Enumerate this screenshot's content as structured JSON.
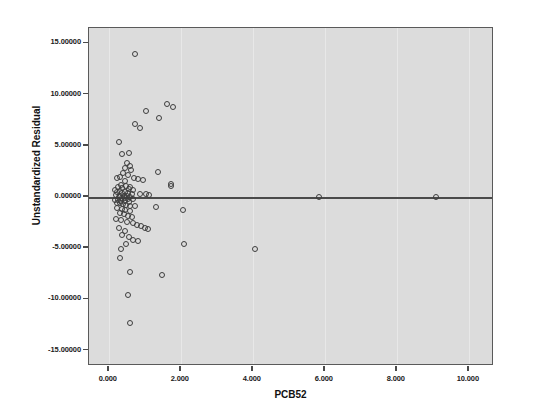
{
  "chart_data": {
    "type": "scatter",
    "title": "",
    "xlabel": "PCB52",
    "ylabel": "Unstandardized Residual",
    "xlim": [
      -0.55,
      10.7
    ],
    "ylim": [
      -16.5,
      16.5
    ],
    "xticks": [
      0,
      2,
      4,
      6,
      8,
      10
    ],
    "xticklabels": [
      "0.000",
      "2.000",
      "4.000",
      "6.000",
      "8.000",
      "10.000"
    ],
    "yticks": [
      15,
      10,
      5,
      0,
      -5,
      -10,
      -15
    ],
    "yticklabels": [
      "15.00000",
      "10.00000",
      "5.00000",
      "0.00000",
      "-5.00000",
      "-10.00000",
      "-15.00000"
    ],
    "grid": false,
    "reference_line_y": 0,
    "marker": "open-circle",
    "marker_color": "#3d3d3d",
    "plot_background": "#dcdcdc",
    "figure_background": "#ffffff",
    "n_points": 96,
    "points": [
      [
        0.72,
        14.0
      ],
      [
        1.62,
        9.1
      ],
      [
        1.78,
        8.75
      ],
      [
        1.02,
        8.35
      ],
      [
        1.4,
        7.75
      ],
      [
        0.72,
        7.15
      ],
      [
        0.88,
        6.75
      ],
      [
        0.28,
        5.35
      ],
      [
        0.36,
        4.2
      ],
      [
        0.55,
        4.25
      ],
      [
        0.5,
        3.35
      ],
      [
        0.58,
        3.05
      ],
      [
        0.46,
        2.85
      ],
      [
        0.62,
        2.6
      ],
      [
        1.38,
        2.45
      ],
      [
        0.4,
        2.3
      ],
      [
        0.52,
        2.15
      ],
      [
        0.3,
        1.95
      ],
      [
        0.22,
        1.9
      ],
      [
        0.7,
        1.85
      ],
      [
        0.8,
        1.8
      ],
      [
        0.95,
        1.7
      ],
      [
        0.44,
        1.55
      ],
      [
        1.72,
        1.25
      ],
      [
        1.72,
        1.05
      ],
      [
        0.34,
        1.2
      ],
      [
        0.48,
        1.1
      ],
      [
        0.6,
        1.0
      ],
      [
        0.26,
        0.95
      ],
      [
        0.38,
        0.85
      ],
      [
        0.56,
        0.8
      ],
      [
        0.68,
        0.72
      ],
      [
        0.18,
        0.65
      ],
      [
        0.3,
        0.58
      ],
      [
        0.44,
        0.52
      ],
      [
        0.24,
        0.45
      ],
      [
        0.36,
        0.4
      ],
      [
        0.52,
        0.35
      ],
      [
        0.64,
        0.3
      ],
      [
        0.88,
        0.28
      ],
      [
        1.02,
        0.25
      ],
      [
        1.12,
        0.22
      ],
      [
        0.2,
        0.18
      ],
      [
        0.32,
        0.14
      ],
      [
        0.42,
        0.1
      ],
      [
        0.5,
        0.06
      ],
      [
        0.58,
        0.02
      ],
      [
        0.28,
        -0.04
      ],
      [
        0.38,
        -0.08
      ],
      [
        0.46,
        -0.12
      ],
      [
        0.54,
        -0.16
      ],
      [
        0.66,
        -0.2
      ],
      [
        0.16,
        -0.25
      ],
      [
        0.26,
        -0.3
      ],
      [
        0.34,
        -0.35
      ],
      [
        0.44,
        -0.42
      ],
      [
        0.56,
        -0.48
      ],
      [
        0.22,
        -0.55
      ],
      [
        0.32,
        -0.62
      ],
      [
        0.4,
        -0.7
      ],
      [
        0.48,
        -0.78
      ],
      [
        0.6,
        -0.85
      ],
      [
        0.72,
        -0.92
      ],
      [
        1.32,
        -0.95
      ],
      [
        0.24,
        -1.05
      ],
      [
        0.36,
        -1.15
      ],
      [
        0.46,
        -1.25
      ],
      [
        0.58,
        -1.35
      ],
      [
        5.85,
        0.02
      ],
      [
        9.1,
        0.02
      ],
      [
        2.05,
        -1.3
      ],
      [
        0.3,
        -1.55
      ],
      [
        0.42,
        -1.7
      ],
      [
        0.52,
        -1.85
      ],
      [
        0.64,
        -1.95
      ],
      [
        0.2,
        -2.1
      ],
      [
        0.34,
        -2.25
      ],
      [
        0.5,
        -2.4
      ],
      [
        0.66,
        -2.55
      ],
      [
        0.78,
        -2.7
      ],
      [
        0.9,
        -2.85
      ],
      [
        1.0,
        -3.0
      ],
      [
        1.1,
        -3.15
      ],
      [
        0.28,
        -3.05
      ],
      [
        0.44,
        -3.3
      ],
      [
        0.38,
        -3.7
      ],
      [
        0.56,
        -3.95
      ],
      [
        0.68,
        -4.15
      ],
      [
        0.8,
        -4.3
      ],
      [
        0.48,
        -4.55
      ],
      [
        0.35,
        -5.05
      ],
      [
        2.1,
        -4.6
      ],
      [
        4.05,
        -5.05
      ],
      [
        0.3,
        -5.95
      ],
      [
        0.6,
        -7.3
      ],
      [
        1.48,
        -7.65
      ],
      [
        0.52,
        -9.55
      ],
      [
        0.58,
        -12.3
      ]
    ]
  }
}
